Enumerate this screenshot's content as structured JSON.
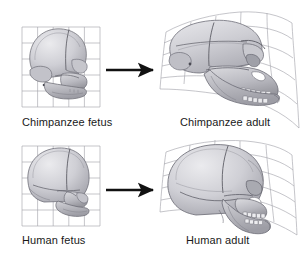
{
  "figure": {
    "background_color": "#ffffff",
    "grid_color": "#9a9aa2",
    "arrow_color": "#111111",
    "bone_fill_light": "#d8d8dc",
    "bone_fill_mid": "#bcbcc2",
    "bone_fill_dark": "#9c9ca4",
    "bone_outline": "#6e6e76",
    "caption_color": "#191919"
  },
  "panels": {
    "chimp_fetus": {
      "caption": "Chimpanzee fetus",
      "icon": "skull-icon",
      "grid_type": "regular",
      "grid_columns": 5,
      "grid_rows": 5,
      "box": {
        "x": 22,
        "y": 27,
        "width": 78,
        "height": 80
      }
    },
    "chimp_adult": {
      "caption": "Chimpanzee adult",
      "icon": "skull-icon",
      "grid_type": "deformed",
      "grid_columns": 5,
      "grid_rows": 5,
      "box": {
        "x": 163,
        "y": 12,
        "width": 135,
        "height": 100
      }
    },
    "human_fetus": {
      "caption": "Human fetus",
      "icon": "skull-icon",
      "grid_type": "regular",
      "grid_columns": 5,
      "grid_rows": 5,
      "box": {
        "x": 22,
        "y": 146,
        "width": 78,
        "height": 80
      }
    },
    "human_adult": {
      "caption": "Human adult",
      "icon": "skull-icon",
      "grid_type": "deformed",
      "grid_columns": 5,
      "grid_rows": 5,
      "box": {
        "x": 163,
        "y": 140,
        "width": 130,
        "height": 95
      }
    }
  },
  "arrows": {
    "top": {
      "name": "transformation-arrow-chimpanzee",
      "from": "Chimpanzee fetus",
      "to": "Chimpanzee adult"
    },
    "bottom": {
      "name": "transformation-arrow-human",
      "from": "Human fetus",
      "to": "Human adult"
    }
  }
}
